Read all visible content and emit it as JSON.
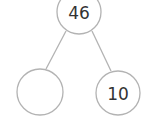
{
  "diagram": {
    "type": "number-bond",
    "partial_left_text": ")",
    "nodes": [
      {
        "id": "whole",
        "label": "46",
        "cx": 79,
        "cy": 12,
        "r": 22
      },
      {
        "id": "part-left",
        "label": "",
        "cx": 40,
        "cy": 92,
        "r": 23
      },
      {
        "id": "part-right",
        "label": "10",
        "cx": 118,
        "cy": 93,
        "r": 22
      }
    ],
    "edges": [
      {
        "from": "whole",
        "to": "part-left"
      },
      {
        "from": "whole",
        "to": "part-right"
      }
    ],
    "colors": {
      "stroke": "#b3b3b3",
      "text": "#333333"
    }
  }
}
